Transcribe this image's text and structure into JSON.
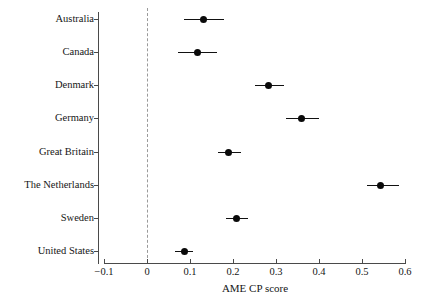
{
  "chart_data": {
    "type": "scatter",
    "title": "",
    "subtitle": "",
    "xlabel": "AME CP score",
    "ylabel": "",
    "xlim": [
      -0.1,
      0.6
    ],
    "xticks": [
      -0.1,
      0,
      0.1,
      0.2,
      0.3,
      0.4,
      0.5,
      0.6
    ],
    "xtick_labels": [
      "−0.1",
      "0",
      "0.1",
      "0.2",
      "0.3",
      "0.4",
      "0.5",
      "0.6"
    ],
    "grid": false,
    "legend": null,
    "reference_line": {
      "value": 0,
      "style": "dashed",
      "color": "#9a9a9a"
    },
    "error_bars": "horizontal 95% CI",
    "categories": [
      "Australia",
      "Canada",
      "Denmark",
      "Germany",
      "Great Britain",
      "The Netherlands",
      "Sweden",
      "United States"
    ],
    "points": [
      {
        "label": "Australia",
        "value": 0.132,
        "low": 0.086,
        "high": 0.179
      },
      {
        "label": "Canada",
        "value": 0.117,
        "low": 0.072,
        "high": 0.163
      },
      {
        "label": "Denmark",
        "value": 0.283,
        "low": 0.25,
        "high": 0.318
      },
      {
        "label": "Germany",
        "value": 0.359,
        "low": 0.324,
        "high": 0.4
      },
      {
        "label": "Great Britain",
        "value": 0.189,
        "low": 0.164,
        "high": 0.219
      },
      {
        "label": "The Netherlands",
        "value": 0.544,
        "low": 0.512,
        "high": 0.585
      },
      {
        "label": "Sweden",
        "value": 0.208,
        "low": 0.184,
        "high": 0.236
      },
      {
        "label": "United States",
        "value": 0.087,
        "low": 0.064,
        "high": 0.108
      }
    ],
    "marker": {
      "shape": "circle",
      "color": "#0a0a0a",
      "size": 7
    }
  },
  "axis": {
    "x_title": "AME CP score"
  }
}
